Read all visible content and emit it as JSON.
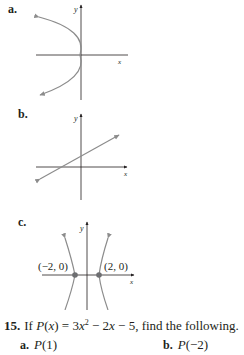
{
  "graphs": [
    {
      "label": "a.",
      "axis_x": "x",
      "axis_y": "y",
      "description": "parabola opening left with vertex at origin"
    },
    {
      "label": "b.",
      "axis_x": "x",
      "axis_y": "y",
      "description": "line with positive slope"
    },
    {
      "label": "c.",
      "axis_x": "x",
      "axis_y": "y",
      "description": "hyperbola opening left and right",
      "points": [
        "(−2, 0)",
        "(2, 0)"
      ]
    }
  ],
  "problem": {
    "number": "15.",
    "prefix": "If ",
    "func": "P",
    "var": "(x)",
    "equals": " = 3",
    "x1": "x",
    "sup": "2",
    "mid": " − 2",
    "x2": "x",
    "tail": " − 5, find the following.",
    "parts": [
      {
        "label": "a.",
        "func": "P",
        "arg": "(1)"
      },
      {
        "label": "b.",
        "func": "P",
        "arg": "(−2)"
      }
    ]
  },
  "colors": {
    "curve": "#8c8c8c",
    "axis": "#231f20",
    "point": "#6d6e71"
  }
}
